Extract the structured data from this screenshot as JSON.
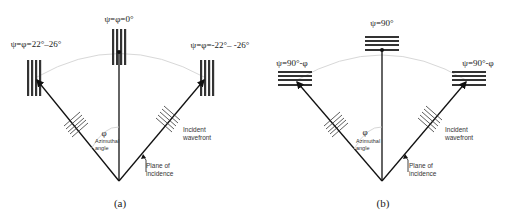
{
  "panels": [
    {
      "id": "a",
      "caption": "(a)",
      "grating_orientation": "vertical",
      "labels": {
        "center": "ψ=φ=0°",
        "left": "ψ=φ=22°–26°",
        "right": "ψ=φ=-22°– -26°",
        "phi": "φ",
        "azimuthal_line1": "Azimuthal",
        "azimuthal_line2": "angle",
        "wavefront_line1": "Incident",
        "wavefront_line2": "wavefront",
        "plane_line1": "Plane of",
        "plane_line2": "incidence"
      }
    },
    {
      "id": "b",
      "caption": "(b)",
      "grating_orientation": "horizontal",
      "labels": {
        "center": "ψ=90°",
        "left": "ψ=90°-φ",
        "right": "ψ=90°-φ",
        "phi": "φ",
        "azimuthal_line1": "Azimuthal",
        "azimuthal_line2": "angle",
        "wavefront_line1": "Incident",
        "wavefront_line2": "wavefront",
        "plane_line1": "Plane of",
        "plane_line2": "incidence"
      }
    }
  ],
  "colors": {
    "line": "#111111",
    "arc": "#d8d8d8",
    "grating": "#333333"
  }
}
